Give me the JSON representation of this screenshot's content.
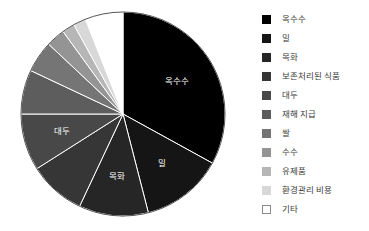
{
  "background_color": "#ffffff",
  "chart_data": {
    "type": "pie",
    "title": "",
    "start_angle_deg": 90,
    "direction": "clockwise",
    "legend_position": "right",
    "grid": false,
    "categories": [
      "옥수수",
      "밀",
      "목화",
      "보존처리된 식품",
      "대두",
      "재해 지급",
      "쌀",
      "수수",
      "유제품",
      "환경관리 비용",
      "기타"
    ],
    "values": [
      33.0,
      13.0,
      11.0,
      9.0,
      9.0,
      7.0,
      5.0,
      3.0,
      2.0,
      2.0,
      6.0
    ],
    "colors": [
      "#000000",
      "#151515",
      "#262626",
      "#363636",
      "#484848",
      "#5d5d5d",
      "#757575",
      "#949494",
      "#b6b6b6",
      "#d8d8d8",
      "#ffffff"
    ],
    "slice_edge_color": "#ffffff",
    "outline_color": "#555555",
    "inner_labels": [
      {
        "text": "옥수수",
        "category": "옥수수"
      },
      {
        "text": "밀",
        "category": "밀"
      },
      {
        "text": "목화",
        "category": "목화"
      },
      {
        "text": "대두",
        "category": "대두"
      }
    ],
    "inner_label_color": "#ffffff"
  },
  "legend": {
    "items": [
      {
        "label": "옥수수",
        "color": "#000000"
      },
      {
        "label": "밀",
        "color": "#151515"
      },
      {
        "label": "목화",
        "color": "#262626"
      },
      {
        "label": "보존처리된 식품",
        "color": "#363636"
      },
      {
        "label": "대두",
        "color": "#484848"
      },
      {
        "label": "재해 지급",
        "color": "#5d5d5d"
      },
      {
        "label": "쌀",
        "color": "#757575"
      },
      {
        "label": "수수",
        "color": "#949494"
      },
      {
        "label": "유제품",
        "color": "#b6b6b6"
      },
      {
        "label": "환경관리 비용",
        "color": "#d8d8d8"
      },
      {
        "label": "기타",
        "color": "#ffffff"
      }
    ]
  }
}
